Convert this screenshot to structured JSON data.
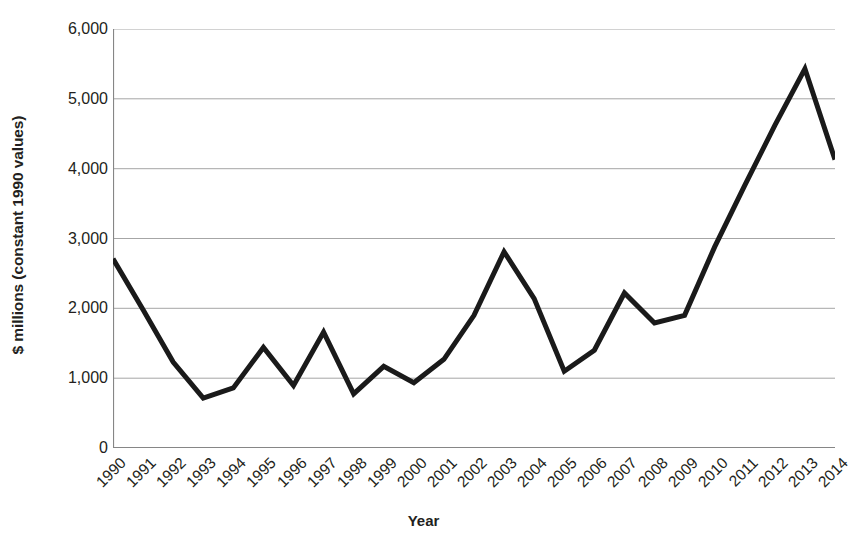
{
  "chart_data": {
    "type": "line",
    "title": "",
    "xlabel": "Year",
    "ylabel": "$ millions (constant 1990 values)",
    "categories": [
      "1990",
      "1991",
      "1992",
      "1993",
      "1994",
      "1995",
      "1996",
      "1997",
      "1998",
      "1999",
      "2000",
      "2001",
      "2002",
      "2003",
      "2004",
      "2005",
      "2006",
      "2007",
      "2008",
      "2009",
      "2010",
      "2011",
      "2012",
      "2013",
      "2014"
    ],
    "values": [
      2710,
      1980,
      1230,
      715,
      860,
      1440,
      895,
      1660,
      775,
      1170,
      935,
      1270,
      1900,
      2810,
      2140,
      1100,
      1400,
      2220,
      1790,
      1900,
      2880,
      3760,
      4620,
      5430,
      4130
    ],
    "series": [
      {
        "name": "$ millions (constant 1990 values)",
        "values": [
          2710,
          1980,
          1230,
          715,
          860,
          1440,
          895,
          1660,
          775,
          1170,
          935,
          1270,
          1900,
          2810,
          2140,
          1100,
          1400,
          2220,
          1790,
          1900,
          2880,
          3760,
          4620,
          5430,
          4130
        ]
      }
    ],
    "ylim": [
      0,
      6000
    ],
    "ytick_values": [
      0,
      1000,
      2000,
      3000,
      4000,
      5000,
      6000
    ],
    "ytick_labels": [
      "0",
      "1,000",
      "2,000",
      "3,000",
      "4,000",
      "5,000",
      "6,000"
    ],
    "grid": "horizontal",
    "legend": "none",
    "line_color": "#1a1a1a",
    "line_width": 5,
    "grid_color": "#a6a6a6",
    "axis_color": "#868686",
    "text_color": "#231f20",
    "background": "#ffffff"
  }
}
